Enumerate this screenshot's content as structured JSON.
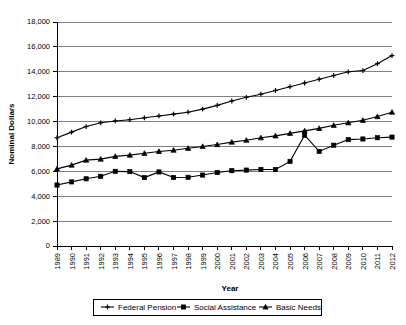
{
  "chart_data": {
    "type": "line",
    "title": "",
    "xlabel": "Year",
    "ylabel": "Nominal Dollars",
    "ylim": [
      0,
      18000
    ],
    "ytick_labels": [
      "18,000",
      "16,000",
      "14,000",
      "12,000",
      "10,000",
      "8,000",
      "6,000",
      "4,000",
      "2,000",
      "0"
    ],
    "ytick_values": [
      18000,
      16000,
      14000,
      12000,
      10000,
      8000,
      6000,
      4000,
      2000,
      0
    ],
    "grid": true,
    "legend_position": "bottom",
    "categories": [
      "1989",
      "1990",
      "1991",
      "1992",
      "1993",
      "1994",
      "1995",
      "1996",
      "1997",
      "1998",
      "1999",
      "2000",
      "2001",
      "2002",
      "2003",
      "2004",
      "2005",
      "2006",
      "2007",
      "2008",
      "2009",
      "2010",
      "2011",
      "2012"
    ],
    "series": [
      {
        "name": "Federal Pension",
        "marker": "plus",
        "values": [
          8700,
          9150,
          9600,
          9900,
          10050,
          10150,
          10300,
          10450,
          10600,
          10750,
          11000,
          11300,
          11650,
          11950,
          12200,
          12500,
          12800,
          13100,
          13400,
          13700,
          14000,
          14100,
          14650,
          15300
        ]
      },
      {
        "name": "Social Assistance",
        "marker": "square",
        "values": [
          4900,
          5150,
          5400,
          5600,
          6000,
          5980,
          5500,
          5950,
          5500,
          5520,
          5700,
          5900,
          6050,
          6100,
          6150,
          6150,
          6800,
          8900,
          7600,
          8100,
          8550,
          8600,
          8700,
          8750
        ]
      },
      {
        "name": "Basic Needs",
        "marker": "triangle",
        "values": [
          6200,
          6500,
          6900,
          6980,
          7200,
          7300,
          7450,
          7600,
          7700,
          7850,
          8000,
          8150,
          8350,
          8500,
          8700,
          8850,
          9050,
          9250,
          9450,
          9700,
          9900,
          10100,
          10400,
          10750
        ]
      }
    ]
  }
}
